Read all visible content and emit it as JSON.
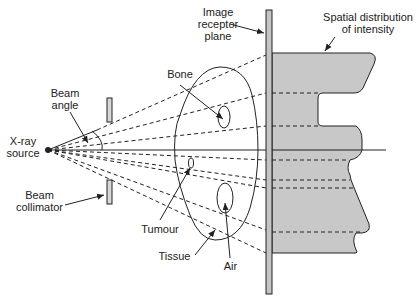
{
  "diagram": {
    "labels": {
      "image_receptor": [
        "Image",
        "receptor",
        "plane"
      ],
      "spatial_distribution": [
        "Spatial distribution",
        "of intensity"
      ],
      "bone": "Bone",
      "beam_angle": [
        "Beam",
        "angle"
      ],
      "xray_source": [
        "X-ray",
        "source"
      ],
      "beam_collimator": [
        "Beam",
        "collimator"
      ],
      "tumour": "Tumour",
      "tissue": "Tissue",
      "air": "Air"
    },
    "colors": {
      "line": "#222222",
      "fill_gray": "#c8c8c8",
      "plate_fill": "#c4c4c4",
      "background": "#ffffff"
    }
  }
}
